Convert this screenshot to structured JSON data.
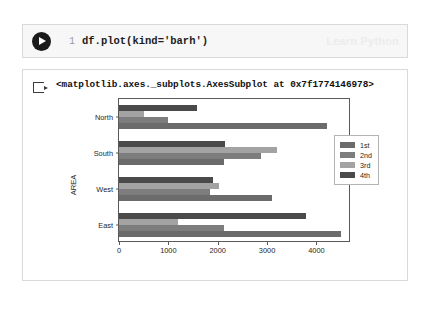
{
  "cell": {
    "run_icon": "play-icon",
    "line_number": "1",
    "code": "df.plot(kind='barh')",
    "watermark": "Learn Python"
  },
  "output": {
    "prompt_icon": "output-arrow-icon",
    "text": "<matplotlib.axes._subplots.AxesSubplot at 0x7f1774146978>"
  },
  "chart_data": {
    "type": "bar",
    "orientation": "horizontal",
    "title": "",
    "xlabel": "",
    "ylabel": "AREA",
    "categories": [
      "North",
      "South",
      "West",
      "East"
    ],
    "series": [
      {
        "name": "1st",
        "color": "#6b6b6b",
        "values": [
          4220,
          2120,
          3100,
          4500
        ]
      },
      {
        "name": "2nd",
        "color": "#7d7d7d",
        "values": [
          1000,
          2880,
          1840,
          2120
        ]
      },
      {
        "name": "3rd",
        "color": "#a3a3a3",
        "values": [
          500,
          3200,
          2030,
          1200
        ]
      },
      {
        "name": "4th",
        "color": "#4a4a4a",
        "values": [
          1580,
          2150,
          1900,
          3790
        ]
      }
    ],
    "xlim": [
      0,
      4700
    ],
    "xticks": [
      0,
      1000,
      2000,
      3000,
      4000
    ],
    "xtick_labels": [
      "0",
      "1000",
      "2000",
      "3000",
      "4000"
    ],
    "grid": false,
    "legend_position": "center right",
    "legend_entries": [
      "1st",
      "2nd",
      "3rd",
      "4th"
    ]
  }
}
